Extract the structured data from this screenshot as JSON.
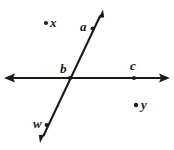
{
  "figure": {
    "background_color": "#ffffff",
    "stroke_color": "#1a1a1a",
    "width": 174,
    "height": 150,
    "labels": {
      "x": "x",
      "a": "a",
      "b": "b",
      "c": "c",
      "y": "y",
      "w": "w"
    },
    "points": [
      {
        "name": "x",
        "label": "x",
        "cx": 46,
        "cy": 23,
        "has_dot": true,
        "on_line": false
      },
      {
        "name": "b",
        "label": "b",
        "cx": 70,
        "cy": 78,
        "has_dot": true,
        "on_line": true
      },
      {
        "name": "c",
        "label": "c",
        "cx": 134,
        "cy": 78,
        "has_dot": true,
        "on_line": true
      },
      {
        "name": "y",
        "label": "y",
        "cx": 136,
        "cy": 105,
        "has_dot": true,
        "on_line": false
      },
      {
        "name": "a",
        "label": "a",
        "cx": 93,
        "cy": 28,
        "has_dot": true,
        "on_line": true
      },
      {
        "name": "w",
        "label": "w",
        "cx": 47,
        "cy": 125,
        "has_dot": true,
        "on_line": true
      }
    ],
    "lines": [
      {
        "name": "horizontal-line",
        "x1": 5,
        "y1": 78,
        "x2": 169,
        "y2": 78,
        "arrow_start": true,
        "arrow_end": true
      },
      {
        "name": "slanted-line",
        "x1": 40,
        "y1": 143,
        "x2": 103,
        "y2": 10,
        "arrow_start": true,
        "arrow_end": true
      }
    ]
  }
}
